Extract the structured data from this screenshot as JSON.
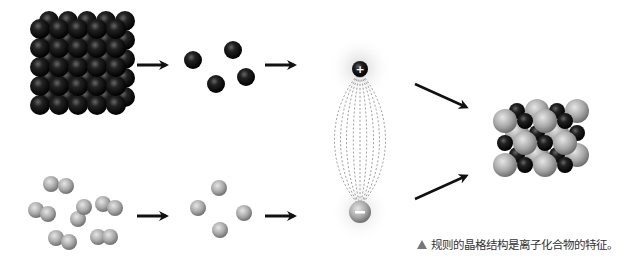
{
  "diagram": {
    "stages": [
      {
        "row": "top",
        "label": "metal-lattice",
        "color": "#111111"
      },
      {
        "row": "top",
        "label": "separated-atoms",
        "color": "#111111"
      },
      {
        "row": "bottom",
        "label": "diatomic-molecules",
        "color": "#999999"
      },
      {
        "row": "bottom",
        "label": "separated-atoms",
        "color": "#999999"
      },
      {
        "label": "ion-pair-attraction"
      },
      {
        "label": "ionic-crystal-lattice"
      }
    ],
    "ions": {
      "positive_sign": "+",
      "negative_sign": "−"
    },
    "colors": {
      "dark_atom": "#1a1a1a",
      "light_atom": "#a8a8a8",
      "arrow": "#111111",
      "field_line": "#888888"
    }
  },
  "caption": {
    "marker_icon": "triangle-icon",
    "text": "规则的晶格结构是离子化合物的特征。"
  }
}
